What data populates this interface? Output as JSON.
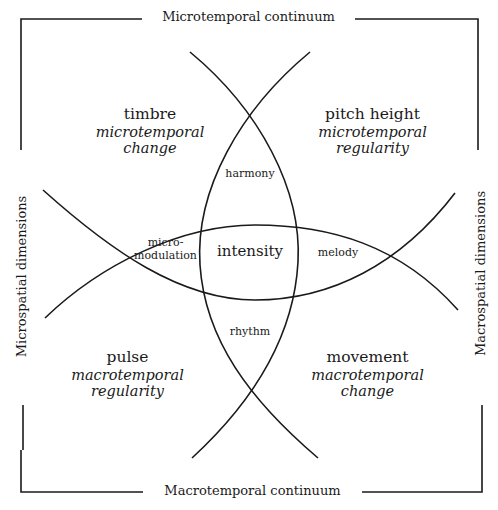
{
  "diagram": {
    "edges": {
      "top": "Microtemporal continuum",
      "bottom": "Macrotemporal continuum",
      "left": "Microspatial dimensions",
      "right": "Macrospatial dimensions"
    },
    "quadrants": {
      "top_left": {
        "title": "timbre",
        "sub1": "microtemporal",
        "sub2": "change"
      },
      "top_right": {
        "title": "pitch height",
        "sub1": "microtemporal",
        "sub2": "regularity"
      },
      "bottom_left": {
        "title": "pulse",
        "sub1": "macrotemporal",
        "sub2": "regularity"
      },
      "bottom_right": {
        "title": "movement",
        "sub1": "macrotemporal",
        "sub2": "change"
      }
    },
    "regions": {
      "top": "harmony",
      "bottom": "rhythm",
      "left_line1": "micro-",
      "left_line2": "modulation",
      "right": "melody",
      "center": "intensity"
    },
    "stroke_color": "#1a1a1a"
  }
}
